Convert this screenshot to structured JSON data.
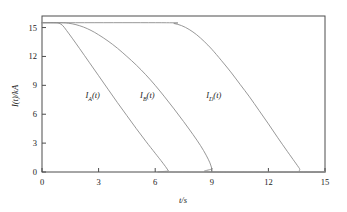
{
  "chart_data": {
    "type": "line",
    "title": "",
    "xlabel": "t/s",
    "ylabel": "I(t)/kA",
    "xlim": [
      0,
      15
    ],
    "ylim": [
      0,
      16.2
    ],
    "xticks": [
      0,
      3,
      6,
      9,
      12,
      15
    ],
    "yticks": [
      0,
      3,
      6,
      9,
      12,
      15
    ],
    "xtick_labels": [
      "0",
      "3",
      "6",
      "9",
      "12",
      "15"
    ],
    "ytick_labels": [
      "0",
      "3",
      "6",
      "9",
      "12",
      "15"
    ],
    "grid": false,
    "legend_position": "inline-annotations",
    "line_color": "#8c8c8c",
    "axis_color": "#4d4d4d",
    "plateau_value": 15.5,
    "annotations": [
      {
        "name": "curve-label-a",
        "text_main": "I",
        "text_sub": "A",
        "text_tail": "(t)",
        "x": 2.3,
        "y": 8.4
      },
      {
        "name": "curve-label-b",
        "text_main": "I",
        "text_sub": "B",
        "text_tail": "(t)",
        "x": 5.2,
        "y": 8.4
      },
      {
        "name": "curve-label-d",
        "text_main": "I",
        "text_sub": "D",
        "text_tail": "(t)",
        "x": 8.7,
        "y": 8.4
      }
    ],
    "series": [
      {
        "name": "I_A(t)",
        "label": "IA(t)",
        "points": [
          [
            0.0,
            15.5
          ],
          [
            0.6,
            15.5
          ],
          [
            0.9,
            15.45
          ],
          [
            1.1,
            15.2
          ],
          [
            1.3,
            14.7
          ],
          [
            1.6,
            13.9
          ],
          [
            2.0,
            12.8
          ],
          [
            2.5,
            11.4
          ],
          [
            3.0,
            10.0
          ],
          [
            3.5,
            8.6
          ],
          [
            4.0,
            7.2
          ],
          [
            4.5,
            5.85
          ],
          [
            5.0,
            4.5
          ],
          [
            5.5,
            3.2
          ],
          [
            6.0,
            1.95
          ],
          [
            6.3,
            1.2
          ],
          [
            6.55,
            0.55
          ],
          [
            6.7,
            0.12
          ],
          [
            6.75,
            0.0
          ],
          [
            15.0,
            0.0
          ]
        ]
      },
      {
        "name": "I_B(t)",
        "label": "IB(t)",
        "points": [
          [
            0.0,
            15.5
          ],
          [
            1.0,
            15.5
          ],
          [
            1.4,
            15.45
          ],
          [
            1.8,
            15.3
          ],
          [
            2.2,
            15.05
          ],
          [
            2.6,
            14.7
          ],
          [
            3.0,
            14.25
          ],
          [
            3.5,
            13.6
          ],
          [
            4.0,
            12.85
          ],
          [
            4.5,
            12.0
          ],
          [
            5.0,
            11.1
          ],
          [
            5.5,
            10.1
          ],
          [
            6.0,
            9.0
          ],
          [
            6.5,
            7.8
          ],
          [
            7.0,
            6.55
          ],
          [
            7.5,
            5.25
          ],
          [
            8.0,
            3.9
          ],
          [
            8.4,
            2.75
          ],
          [
            8.7,
            1.75
          ],
          [
            8.9,
            0.95
          ],
          [
            9.0,
            0.35
          ],
          [
            9.05,
            0.0
          ],
          [
            15.0,
            0.0
          ]
        ]
      },
      {
        "name": "I_D(t)",
        "label": "ID(t)",
        "points": [
          [
            0.0,
            15.5
          ],
          [
            6.6,
            15.5
          ],
          [
            7.0,
            15.42
          ],
          [
            7.4,
            15.2
          ],
          [
            7.8,
            14.8
          ],
          [
            8.2,
            14.25
          ],
          [
            8.6,
            13.55
          ],
          [
            9.0,
            12.75
          ],
          [
            9.5,
            11.6
          ],
          [
            10.0,
            10.4
          ],
          [
            10.5,
            9.1
          ],
          [
            11.0,
            7.8
          ],
          [
            11.5,
            6.4
          ],
          [
            12.0,
            5.0
          ],
          [
            12.5,
            3.55
          ],
          [
            13.0,
            2.15
          ],
          [
            13.4,
            1.05
          ],
          [
            13.65,
            0.35
          ],
          [
            13.75,
            0.0
          ],
          [
            15.0,
            0.0
          ]
        ]
      }
    ]
  }
}
